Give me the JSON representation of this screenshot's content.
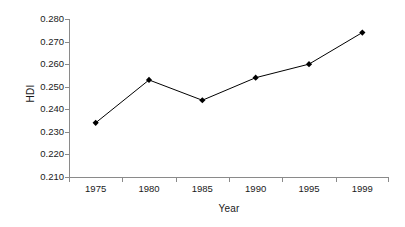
{
  "chart_data": {
    "type": "line",
    "title": "",
    "xlabel": "Year",
    "ylabel": "HDI",
    "categories": [
      "1975",
      "1980",
      "1985",
      "1990",
      "1995",
      "1999"
    ],
    "values": [
      0.234,
      0.253,
      0.244,
      0.254,
      0.26,
      0.274
    ],
    "series": [
      {
        "name": "HDI",
        "values": [
          0.234,
          0.253,
          0.244,
          0.254,
          0.26,
          0.274
        ]
      }
    ],
    "ylim": [
      0.21,
      0.28
    ],
    "ytick_labels": [
      "0.280",
      "0.270",
      "0.260",
      "0.250",
      "0.240",
      "0.230",
      "0.220",
      "0.210"
    ],
    "ytick_values": [
      0.28,
      0.27,
      0.26,
      0.25,
      0.24,
      0.23,
      0.22,
      0.21
    ],
    "ytick_step": 0.01,
    "grid": false,
    "legend": false,
    "legend_position": "none",
    "marker": "diamond",
    "line_color": "#000000",
    "marker_color": "#000000",
    "axis_color": "#8a8a8a",
    "background_color": "#ffffff"
  }
}
